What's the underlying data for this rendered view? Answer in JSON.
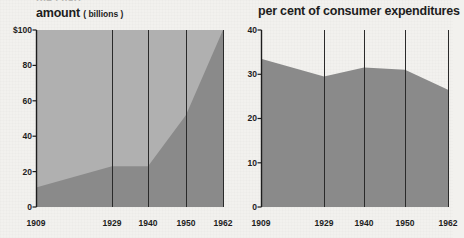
{
  "page": {
    "cut_off_heading": "the chart",
    "background_color": "#f2f1ee",
    "area_fill_color": "#8a8a8a",
    "band_fill_color": "#b0b0b0",
    "axis_color": "#222222"
  },
  "charts": [
    {
      "id": "amount",
      "title": "amount",
      "title_suffix": "( billions )",
      "axis": {
        "y_ticks": [
          "$100",
          "80",
          "60",
          "40",
          "20",
          "0"
        ],
        "y_values": [
          100,
          80,
          60,
          40,
          20,
          0
        ],
        "x_ticks": [
          "1909",
          "1929",
          "1940",
          "1950",
          "1962"
        ]
      }
    },
    {
      "id": "per-cent",
      "title": "per cent of consumer expenditures",
      "axis": {
        "y_ticks": [
          "40",
          "30",
          "20",
          "10",
          "0"
        ],
        "y_values": [
          40,
          30,
          20,
          10,
          0
        ],
        "x_ticks": [
          "1909",
          "1929",
          "1940",
          "1950",
          "1962"
        ]
      }
    }
  ],
  "chart_data": [
    {
      "type": "area",
      "title": "amount ( billions )",
      "xlabel": "",
      "ylabel": "amount (billions of dollars)",
      "categories": [
        "1909",
        "1929",
        "1940",
        "1950",
        "1962"
      ],
      "values": [
        11,
        23,
        23,
        52,
        100
      ],
      "ylim": [
        0,
        100
      ],
      "yticks": [
        0,
        20,
        40,
        60,
        80,
        100
      ],
      "ytick_labels": [
        "0",
        "20",
        "40",
        "60",
        "80",
        "$100"
      ],
      "grid": "vertical-only",
      "legend": "none",
      "fill_color": "#8a8a8a"
    },
    {
      "type": "area",
      "title": "per cent of consumer expenditures",
      "xlabel": "",
      "ylabel": "per cent",
      "categories": [
        "1909",
        "1929",
        "1940",
        "1950",
        "1962"
      ],
      "values": [
        33.5,
        29.5,
        31.5,
        31.0,
        26.5
      ],
      "ylim": [
        0,
        40
      ],
      "yticks": [
        0,
        10,
        20,
        30,
        40
      ],
      "ytick_labels": [
        "0",
        "10",
        "20",
        "30",
        "40"
      ],
      "grid": "vertical-only",
      "legend": "none",
      "fill_color": "#8a8a8a"
    }
  ]
}
